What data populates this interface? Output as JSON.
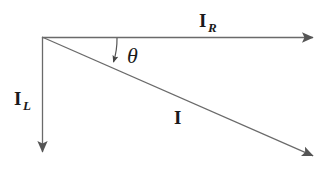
{
  "figure": {
    "kind": "vector-phasor-diagram",
    "title": "",
    "background_color": "#ffffff",
    "stroke_color": "#555555",
    "text_color": "#1a1a1a",
    "width": 334,
    "height": 172
  },
  "origin": {
    "x": 42,
    "y": 37
  },
  "vectors": [
    {
      "id": "ir",
      "symbol": "I",
      "subscript": "R",
      "label_text": "I",
      "subscript_text": "R",
      "direction": "horizontal-right",
      "from": {
        "x": 42,
        "y": 37
      },
      "to": {
        "x": 318,
        "y": 38
      },
      "label_position": {
        "x": 199,
        "y": 11
      }
    },
    {
      "id": "il",
      "symbol": "I",
      "subscript": "L",
      "label_text": "I",
      "subscript_text": "L",
      "direction": "vertical-down",
      "from": {
        "x": 42,
        "y": 37
      },
      "to": {
        "x": 43,
        "y": 157
      },
      "label_position": {
        "x": 14,
        "y": 89
      }
    },
    {
      "id": "i",
      "symbol": "I",
      "subscript": "",
      "label_text": "I",
      "subscript_text": "",
      "direction": "diagonal-down-right",
      "from": {
        "x": 42,
        "y": 37
      },
      "to": {
        "x": 318,
        "y": 158
      },
      "label_position": {
        "x": 174,
        "y": 108
      }
    }
  ],
  "angle": {
    "id": "theta",
    "label_text": "θ",
    "between": [
      "ir",
      "i"
    ],
    "arc_from": {
      "x": 116,
      "y": 38
    },
    "arc_to": {
      "x": 113,
      "y": 67
    },
    "label_position": {
      "x": 127,
      "y": 45
    }
  }
}
